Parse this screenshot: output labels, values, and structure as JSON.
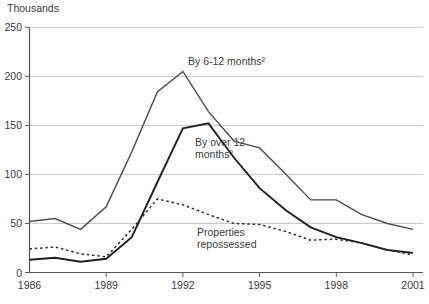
{
  "unit_label": "Thousands",
  "colors": {
    "axis": "#58595b",
    "grid": "#c7c8ca",
    "text": "#3b3b3c"
  },
  "chart_data": {
    "type": "line",
    "title": "",
    "ylabel": "Thousands",
    "xlabel": "",
    "ylim": [
      0,
      250
    ],
    "yticks": [
      0,
      50,
      100,
      150,
      200,
      250
    ],
    "xticks": [
      1986,
      1989,
      1992,
      1995,
      1998,
      2001
    ],
    "grid": "horizontal",
    "legend_position": "inline-labels",
    "x": [
      1986,
      1987,
      1988,
      1989,
      1990,
      1991,
      1992,
      1993,
      1994,
      1995,
      1996,
      1997,
      1998,
      1999,
      2000,
      2001
    ],
    "series": [
      {
        "name": "By 6-12 months",
        "label": "By 6-12 months²",
        "style": "solid",
        "color": "#4d4d4d",
        "width": 1.4,
        "values": [
          52,
          55,
          44,
          67,
          123,
          184,
          205,
          164,
          134,
          127,
          101,
          74,
          74,
          59,
          50,
          44
        ]
      },
      {
        "name": "By over 12 months",
        "label_lines": [
          "By over 12",
          "months²"
        ],
        "style": "solid",
        "color": "#231f20",
        "width": 1.9,
        "values": [
          13,
          15,
          11,
          14,
          36,
          92,
          147,
          152,
          117,
          86,
          64,
          46,
          36,
          30,
          23,
          20
        ]
      },
      {
        "name": "Properties repossessed",
        "label_lines": [
          "Properties",
          "repossessed"
        ],
        "style": "dashed",
        "color": "#2d2d2d",
        "width": 1.5,
        "values": [
          24,
          26,
          19,
          16,
          44,
          75,
          69,
          59,
          50,
          49,
          42,
          33,
          34,
          30,
          23,
          18
        ]
      }
    ]
  }
}
